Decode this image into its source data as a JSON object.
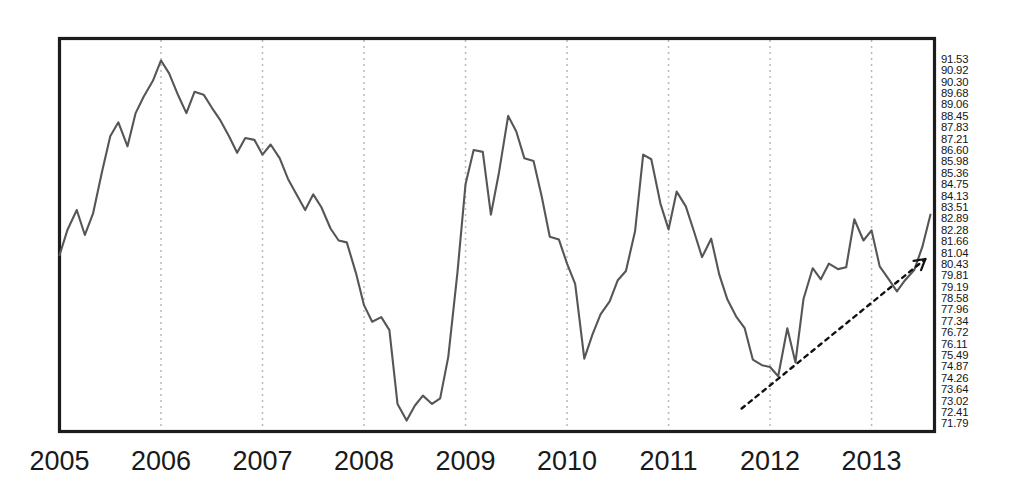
{
  "chart_data": {
    "type": "line",
    "title": "",
    "subtitle": "",
    "xlabel": "",
    "ylabel": "",
    "grid": true,
    "legend": null,
    "legend_position": "none",
    "xlim": [
      2005.0,
      2013.62
    ],
    "ylim": [
      71.79,
      91.53
    ],
    "x_tick_labels": [
      "2005",
      "2006",
      "2007",
      "2008",
      "2009",
      "2010",
      "2011",
      "2012",
      "2013"
    ],
    "x_tick_values": [
      2005,
      2006,
      2007,
      2008,
      2009,
      2010,
      2011,
      2012,
      2013
    ],
    "y_tick_labels": [
      "91.53",
      "90.92",
      "90.30",
      "89.68",
      "89.06",
      "88.45",
      "87.83",
      "87.21",
      "86.60",
      "85.98",
      "85.36",
      "84.75",
      "84.13",
      "83.51",
      "82.89",
      "82.28",
      "81.66",
      "81.04",
      "80.43",
      "79.81",
      "79.19",
      "78.58",
      "77.96",
      "77.34",
      "76.72",
      "76.11",
      "75.49",
      "74.87",
      "74.26",
      "73.64",
      "73.02",
      "72.41",
      "71.79"
    ],
    "y_tick_values": [
      91.53,
      90.92,
      90.3,
      89.68,
      89.06,
      88.45,
      87.83,
      87.21,
      86.6,
      85.98,
      85.36,
      84.75,
      84.13,
      83.51,
      82.89,
      82.28,
      81.66,
      81.04,
      80.43,
      79.81,
      79.19,
      78.58,
      77.96,
      77.34,
      76.72,
      76.11,
      75.49,
      74.87,
      74.26,
      73.64,
      73.02,
      72.41,
      71.79
    ],
    "y_axis_side": "right",
    "series": [
      {
        "name": "index",
        "color": "#565656",
        "x": [
          2005.0,
          2005.08,
          2005.17,
          2005.25,
          2005.33,
          2005.42,
          2005.5,
          2005.58,
          2005.67,
          2005.75,
          2005.83,
          2005.92,
          2006.0,
          2006.08,
          2006.17,
          2006.25,
          2006.33,
          2006.42,
          2006.5,
          2006.58,
          2006.67,
          2006.75,
          2006.83,
          2006.92,
          2007.0,
          2007.08,
          2007.17,
          2007.25,
          2007.33,
          2007.42,
          2007.5,
          2007.58,
          2007.67,
          2007.75,
          2007.83,
          2007.92,
          2008.0,
          2008.08,
          2008.17,
          2008.25,
          2008.33,
          2008.42,
          2008.5,
          2008.58,
          2008.67,
          2008.75,
          2008.83,
          2008.92,
          2009.0,
          2009.08,
          2009.17,
          2009.25,
          2009.33,
          2009.42,
          2009.5,
          2009.58,
          2009.67,
          2009.75,
          2009.83,
          2009.92,
          2010.0,
          2010.08,
          2010.17,
          2010.25,
          2010.33,
          2010.42,
          2010.5,
          2010.58,
          2010.67,
          2010.75,
          2010.83,
          2010.92,
          2011.0,
          2011.08,
          2011.17,
          2011.25,
          2011.33,
          2011.42,
          2011.5,
          2011.58,
          2011.67,
          2011.75,
          2011.83,
          2011.92,
          2012.0,
          2012.08,
          2012.17,
          2012.25,
          2012.33,
          2012.42,
          2012.5,
          2012.58,
          2012.67,
          2012.75,
          2012.83,
          2012.92,
          2013.0,
          2013.08,
          2013.17,
          2013.25,
          2013.33,
          2013.42,
          2013.5,
          2013.58
        ],
        "y": [
          80.9,
          82.3,
          83.35,
          82.0,
          83.15,
          85.45,
          87.35,
          88.1,
          86.8,
          88.6,
          89.5,
          90.35,
          91.45,
          90.75,
          89.55,
          88.6,
          89.75,
          89.6,
          88.9,
          88.25,
          87.35,
          86.45,
          87.25,
          87.15,
          86.35,
          86.9,
          86.15,
          85.05,
          84.25,
          83.35,
          84.2,
          83.5,
          82.35,
          81.7,
          81.6,
          79.95,
          78.2,
          77.3,
          77.55,
          76.85,
          72.85,
          71.95,
          72.75,
          73.3,
          72.85,
          73.15,
          75.4,
          79.95,
          84.75,
          86.6,
          86.5,
          83.1,
          85.4,
          88.45,
          87.6,
          86.15,
          86.0,
          84.1,
          81.9,
          81.75,
          80.45,
          79.35,
          75.3,
          76.6,
          77.7,
          78.4,
          79.55,
          80.05,
          82.2,
          86.35,
          86.1,
          83.7,
          82.3,
          84.35,
          83.55,
          82.2,
          80.8,
          81.8,
          79.85,
          78.5,
          77.55,
          76.95,
          75.25,
          74.95,
          74.85,
          74.35,
          76.95,
          75.1,
          78.55,
          80.2,
          79.6,
          80.45,
          80.15,
          80.25,
          82.85,
          81.7,
          82.25,
          80.3,
          79.6,
          78.95,
          79.55,
          80.1,
          81.35,
          83.1
        ]
      }
    ],
    "annotations": [
      {
        "name": "trend-arrow",
        "type": "arrow",
        "style": "dotted",
        "x_start": 2011.72,
        "y_start": 72.6,
        "x_end": 2013.53,
        "y_end": 80.7,
        "label": ""
      }
    ]
  }
}
